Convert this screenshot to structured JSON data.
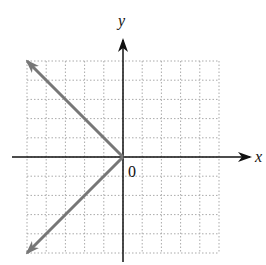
{
  "chart_data": {
    "type": "line",
    "title": "",
    "xlabel": "x",
    "ylabel": "y",
    "origin_label": "0",
    "xlim": [
      -5,
      5
    ],
    "ylim": [
      -5,
      5
    ],
    "grid": true,
    "grid_step": 1,
    "series": [
      {
        "name": "x = -|y|",
        "color": "#777777",
        "points": [
          [
            -5,
            5
          ],
          [
            0,
            0
          ],
          [
            -5,
            -5
          ]
        ],
        "arrows_at_ends": true
      }
    ]
  },
  "colors": {
    "axis": "#111111",
    "grid": "#aaaaaa",
    "graph": "#777777"
  }
}
